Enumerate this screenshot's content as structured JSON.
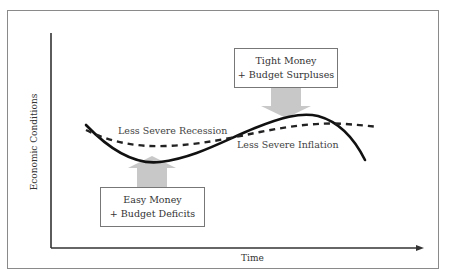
{
  "diagram": {
    "axes": {
      "x_label": "Time",
      "y_label": "Economic Conditions"
    },
    "curves": {
      "solid": {
        "name": "business-cycle-without-policy",
        "style": "solid",
        "color": "#111111"
      },
      "dashed": {
        "name": "business-cycle-with-policy",
        "style": "dashed",
        "color": "#222222"
      }
    },
    "labels": {
      "recession": "Less Severe Recession",
      "inflation": "Less Severe Inflation"
    },
    "boxes": {
      "easy": {
        "line1": "Easy Money",
        "line2": "+ Budget Deficits",
        "arrow_direction": "up"
      },
      "tight": {
        "line1": "Tight Money",
        "line2": "+ Budget Surpluses",
        "arrow_direction": "down"
      }
    },
    "colors": {
      "arrow_fill": "#c8c8c8",
      "frame": "#8a8a8a",
      "axis": "#333333"
    }
  }
}
